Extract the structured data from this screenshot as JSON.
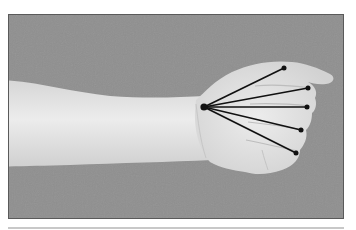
{
  "figure": {
    "background_color": "#8f8f8f",
    "skin_color": "#e2e2e2",
    "line_color": "#111111",
    "origin_point": {
      "x": 204,
      "y": 107
    },
    "tip_points": [
      {
        "name": "thumb",
        "x": 284,
        "y": 68
      },
      {
        "name": "index",
        "x": 308,
        "y": 88
      },
      {
        "name": "middle",
        "x": 307,
        "y": 107
      },
      {
        "name": "ring",
        "x": 301,
        "y": 130
      },
      {
        "name": "pinky",
        "x": 296,
        "y": 153
      }
    ]
  }
}
